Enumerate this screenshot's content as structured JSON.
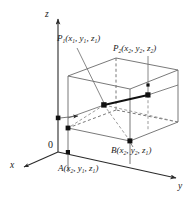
{
  "figure": {
    "background_color": "#ffffff",
    "line_color": "#555555",
    "axis_color": "#2b2b2b",
    "text_color": "#1a1a1a",
    "width": 196,
    "height": 197
  },
  "axes": {
    "z_label": "z",
    "y_label": "y",
    "x_label": "x",
    "origin_label": "0"
  },
  "points": {
    "p1": {
      "name": "P",
      "subscript": "1",
      "coords": "(x₁, y₁, z₁)",
      "label_main": "P",
      "label_sub": "1",
      "open_paren": "(",
      "c1": "x",
      "c1s": "1",
      "c2": "y",
      "c2s": "1",
      "c3": "z",
      "c3s": "1",
      "close_paren": ")",
      "comma": ", "
    },
    "p2": {
      "label_main": "P",
      "label_sub": "2",
      "open_paren": "(",
      "c1": "x",
      "c1s": "2",
      "c2": "y",
      "c2s": "2",
      "c3": "z",
      "c3s": "2",
      "close_paren": ")",
      "comma": ", "
    },
    "a": {
      "label_main": "A",
      "open_paren": "(",
      "c1": "x",
      "c1s": "2",
      "c2": "y",
      "c2s": "1",
      "c3": "z",
      "c3s": "1",
      "close_paren": ")",
      "comma": ", "
    },
    "b": {
      "label_main": "B",
      "open_paren": "(",
      "c1": "x",
      "c1s": "2",
      "c2": "y",
      "c2s": "2",
      "c3": "z",
      "c3s": "1",
      "close_paren": ")",
      "comma": ", "
    }
  }
}
